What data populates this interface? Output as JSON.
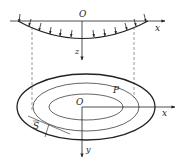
{
  "diagram": {
    "type": "membrane-deflection-schematic",
    "section_view": {
      "origin_label": "O",
      "x_axis_label": "x",
      "z_axis_label": "z",
      "load_arrow_count": 14
    },
    "plan_view": {
      "origin_label": "O",
      "x_axis_label": "x",
      "y_axis_label": "y",
      "boundary_point_label": "P",
      "boundary_label": "S"
    },
    "colors": {
      "stroke": "#222222",
      "dashed": "#555555",
      "background": "#ffffff"
    }
  }
}
